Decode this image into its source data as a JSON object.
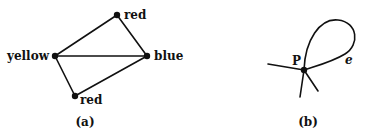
{
  "figure_a": {
    "caption": "(a)",
    "nodes": [
      {
        "id": "red_top",
        "label": "red",
        "x": 117,
        "y": 15
      },
      {
        "id": "yellow",
        "label": "yellow",
        "x": 55,
        "y": 56
      },
      {
        "id": "blue",
        "label": "blue",
        "x": 147,
        "y": 56
      },
      {
        "id": "red_bottom",
        "label": "red",
        "x": 75,
        "y": 96
      }
    ],
    "edges": [
      [
        "yellow",
        "red_top"
      ],
      [
        "red_top",
        "blue"
      ],
      [
        "yellow",
        "blue"
      ],
      [
        "yellow",
        "red_bottom"
      ],
      [
        "red_bottom",
        "blue"
      ]
    ]
  },
  "figure_b": {
    "caption": "(b)",
    "vertex_label": "P",
    "loop_label": "e"
  },
  "colors": {
    "ink": "#111111",
    "background": "#ffffff"
  }
}
